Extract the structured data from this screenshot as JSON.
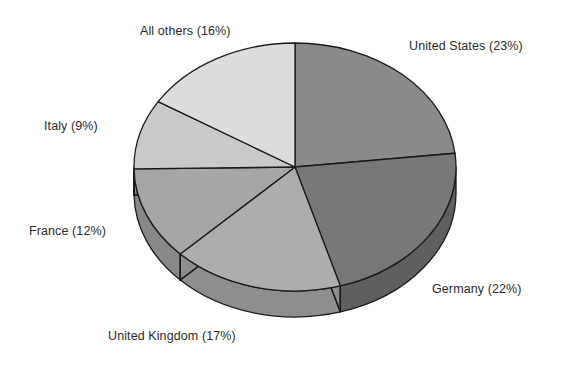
{
  "chart_data": {
    "type": "pie",
    "title": "",
    "subtitle": "",
    "xlabel": "",
    "ylabel": "",
    "legend_position": "none",
    "grid": false,
    "units": "percent",
    "start_angle_deg": 0,
    "direction": "clockwise",
    "three_d": true,
    "categories": [
      "United States",
      "Germany",
      "United Kingdom",
      "France",
      "Italy",
      "All others"
    ],
    "values": [
      23,
      22,
      17,
      12,
      9,
      16
    ],
    "slices": [
      {
        "name": "United States",
        "value": 23,
        "label": "United States (23%)",
        "percent_text": "23%",
        "color": "#8a8a8a",
        "side_color": "#6d6d6d"
      },
      {
        "name": "Germany",
        "value": 22,
        "label": "Germany (22%)",
        "percent_text": "22%",
        "color": "#787878",
        "side_color": "#5f5f5f"
      },
      {
        "name": "United Kingdom",
        "value": 17,
        "label": "United Kingdom (17%)",
        "percent_text": "17%",
        "color": "#adadad",
        "side_color": "#8e8e8e"
      },
      {
        "name": "France",
        "value": 12,
        "label": "France (12%)",
        "percent_text": "12%",
        "color": "#a6a6a6",
        "side_color": "#888888"
      },
      {
        "name": "Italy",
        "value": 9,
        "label": "Italy (9%)",
        "percent_text": "9%",
        "color": "#c9c9c9",
        "side_color": "#a6a6a6"
      },
      {
        "name": "All others",
        "value": 16,
        "label": "All others (16%)",
        "percent_text": "16%",
        "color": "#dcdcdc",
        "side_color": "#b6b6b6"
      }
    ],
    "outline_color": "#1a1a1a",
    "label_color": "#2b2b2b",
    "background": "#ffffff"
  },
  "labels": {
    "united_states": "United States (23%)",
    "germany": "Germany (22%)",
    "united_kingdom": "United Kingdom (17%)",
    "france": "France (12%)",
    "italy": "Italy (9%)",
    "all_others": "All others (16%)"
  }
}
